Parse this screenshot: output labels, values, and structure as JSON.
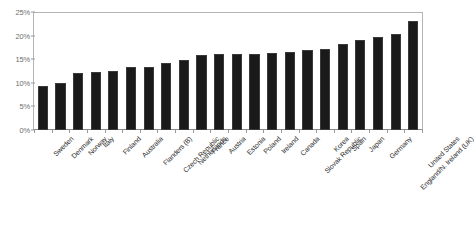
{
  "chart_data": {
    "type": "bar",
    "title": "",
    "subtitle": "",
    "xlabel": "",
    "ylabel": "",
    "ylim": [
      0,
      25
    ],
    "ytick_labels": [
      "25%",
      "20%",
      "15%",
      "10%",
      "5%",
      "0%"
    ],
    "ytick_values": [
      25,
      20,
      15,
      10,
      5,
      0
    ],
    "grid": false,
    "legend": false,
    "legend_position": "none",
    "value_suffix": "%",
    "bar_color": "#1a1a1a",
    "axis_color": "#9a9a9a",
    "axis_text_color": "#6e6e6e",
    "label_text_color": "#2b2b2b",
    "categories": [
      "Sweden",
      "Denmark",
      "Norway",
      "Italy",
      "Finland",
      "Australia",
      "Flanders (B)",
      "Czech Republic",
      "Netherlands",
      "France",
      "Austria",
      "Estonia",
      "Poland",
      "Ireland",
      "Canada",
      "Slovak Republic",
      "Korea",
      "Spain",
      "Japan",
      "Germany",
      "England/N. Ireland (UK)",
      "United States"
    ],
    "values": [
      9.4,
      10.0,
      12.0,
      12.2,
      12.5,
      13.3,
      13.4,
      14.3,
      14.8,
      15.9,
      16.0,
      16.0,
      16.2,
      16.4,
      16.6,
      17.0,
      17.2,
      18.2,
      19.0,
      19.8,
      20.4,
      23.2
    ]
  }
}
